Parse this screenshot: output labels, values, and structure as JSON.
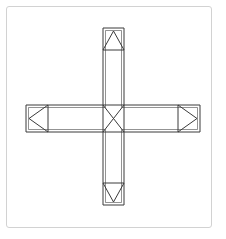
{
  "canvas": {
    "width": 226,
    "height": 239,
    "background_color": "#ffffff"
  },
  "frame": {
    "label": "image-border",
    "x": 6,
    "y": 6,
    "width": 206,
    "height": 222,
    "stroke_color": "#d2d2d2",
    "stroke_width": 1,
    "corner_radius": 3
  },
  "diagram": {
    "type": "line-drawing",
    "stroke_color": "#3a3a3a",
    "stroke_width": 1,
    "fill_color": "none",
    "geometry": {
      "horizontal_bar": {
        "x1": 26,
        "y1": 105,
        "x2": 200,
        "y2": 132
      },
      "vertical_bar": {
        "x1": 103,
        "y1": 28,
        "x2": 124,
        "y2": 205
      },
      "center_square": {
        "x1": 103,
        "y1": 105,
        "x2": 124,
        "y2": 132
      },
      "inner_offset": 2.5
    },
    "center": {
      "label": "center-crossing",
      "marker": "X",
      "diagonals": [
        {
          "x1": 103,
          "y1": 105,
          "x2": 124,
          "y2": 132
        },
        {
          "x1": 124,
          "y1": 105,
          "x2": 103,
          "y2": 132
        }
      ]
    },
    "termini": [
      {
        "id": "top",
        "label": "top-arm-terminus",
        "direction": "up",
        "arrow_glyph": "triangle-up",
        "box": {
          "x1": 103,
          "y1": 28,
          "x2": 124,
          "y2": 50
        },
        "triangle": [
          {
            "x": 103,
            "y": 50
          },
          {
            "x": 113.5,
            "y": 31
          },
          {
            "x": 124,
            "y": 50
          }
        ],
        "double_edge": "top"
      },
      {
        "id": "left",
        "label": "left-arm-terminus",
        "direction": "left",
        "arrow_glyph": "triangle-left",
        "box": {
          "x1": 26,
          "y1": 105,
          "x2": 48,
          "y2": 132
        },
        "triangle": [
          {
            "x": 48,
            "y": 105
          },
          {
            "x": 29,
            "y": 118.5
          },
          {
            "x": 48,
            "y": 132
          }
        ],
        "double_edge": "left"
      },
      {
        "id": "right",
        "label": "right-arm-terminus",
        "direction": "right",
        "arrow_glyph": "triangle-right",
        "box": {
          "x1": 178,
          "y1": 105,
          "x2": 200,
          "y2": 132
        },
        "triangle": [
          {
            "x": 178,
            "y": 105
          },
          {
            "x": 197,
            "y": 118.5
          },
          {
            "x": 178,
            "y": 132
          }
        ],
        "double_edge": "right"
      },
      {
        "id": "bottom",
        "label": "bottom-arm-terminus",
        "direction": "down",
        "arrow_glyph": "triangle-down",
        "box": {
          "x1": 103,
          "y1": 183,
          "x2": 124,
          "y2": 205
        },
        "triangle": [
          {
            "x": 103,
            "y": 183
          },
          {
            "x": 113.5,
            "y": 202
          },
          {
            "x": 124,
            "y": 183
          }
        ],
        "double_edge": "bottom"
      }
    ]
  }
}
